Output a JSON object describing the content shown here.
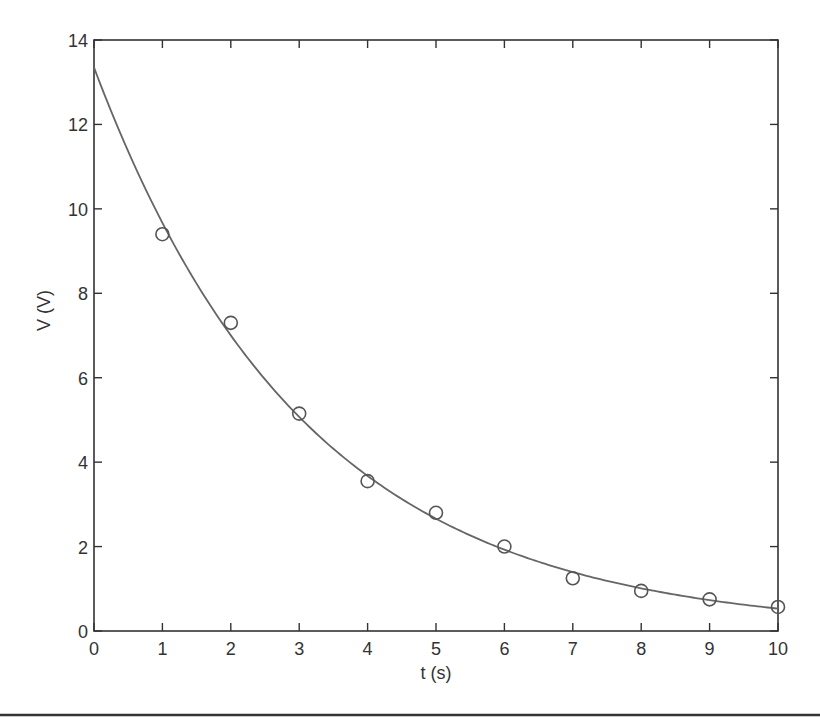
{
  "chart_data": {
    "type": "scatter",
    "title": "",
    "xlabel": "t (s)",
    "ylabel": "V (V)",
    "xlim": [
      0,
      10
    ],
    "ylim": [
      0,
      14
    ],
    "xticks": [
      0,
      1,
      2,
      3,
      4,
      5,
      6,
      7,
      8,
      9,
      10
    ],
    "yticks": [
      0,
      2,
      4,
      6,
      8,
      10,
      12,
      14
    ],
    "grid": false,
    "series": [
      {
        "name": "measured",
        "kind": "markers",
        "marker": "circle",
        "x": [
          1,
          2,
          3,
          4,
          5,
          6,
          7,
          8,
          9,
          10
        ],
        "y": [
          9.4,
          7.3,
          5.15,
          3.55,
          2.8,
          2.0,
          1.25,
          0.95,
          0.75,
          0.57
        ]
      },
      {
        "name": "fit",
        "kind": "line",
        "model": "V0*exp(-t/tau)",
        "V0": 13.35,
        "tau": 3.1
      }
    ]
  }
}
